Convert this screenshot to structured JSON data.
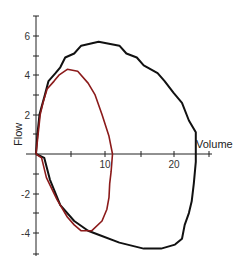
{
  "chart_data": {
    "type": "line",
    "title": "",
    "xlabel": "Volume",
    "ylabel": "Flow",
    "xlim": [
      0,
      25
    ],
    "ylim": [
      -5,
      7
    ],
    "grid": false,
    "legend": null,
    "x_ticks": [
      0,
      5,
      10,
      15,
      20,
      25
    ],
    "x_tick_labels": [
      "",
      "",
      "10",
      "",
      "20",
      ""
    ],
    "y_ticks": [
      -5,
      -4,
      -3,
      -2,
      -1,
      0,
      1,
      2,
      3,
      4,
      5,
      6,
      7
    ],
    "y_tick_labels": {
      "6": "6",
      "4": "4",
      "2": "2",
      "-2": "-2",
      "-4": "-4"
    },
    "series": [
      {
        "name": "large loop",
        "color": "#111111",
        "points": [
          [
            0,
            0
          ],
          [
            0.2,
            1
          ],
          [
            0.5,
            2
          ],
          [
            0.8,
            2.4
          ],
          [
            1.2,
            2.9
          ],
          [
            1.8,
            3.7
          ],
          [
            2.8,
            4.1
          ],
          [
            3.5,
            4.4
          ],
          [
            4.2,
            4.9
          ],
          [
            5.5,
            5.1
          ],
          [
            6.5,
            5.5
          ],
          [
            9,
            5.7
          ],
          [
            12,
            5.5
          ],
          [
            13,
            5.1
          ],
          [
            14.5,
            4.9
          ],
          [
            15.5,
            4.5
          ],
          [
            17.5,
            4.1
          ],
          [
            18.5,
            3.7
          ],
          [
            19.8,
            3.1
          ],
          [
            21,
            2.6
          ],
          [
            22,
            1.7
          ],
          [
            23,
            1.1
          ],
          [
            23,
            -0.4
          ],
          [
            22.7,
            -1.5
          ],
          [
            22.4,
            -2.4
          ],
          [
            22,
            -3
          ],
          [
            21.4,
            -3.6
          ],
          [
            21,
            -4.3
          ],
          [
            20,
            -4.6
          ],
          [
            18,
            -4.8
          ],
          [
            15.5,
            -4.8
          ],
          [
            12,
            -4.5
          ],
          [
            9,
            -4.1
          ],
          [
            7.5,
            -3.9
          ],
          [
            5.5,
            -3.4
          ],
          [
            3.5,
            -2.6
          ],
          [
            2,
            -1.3
          ],
          [
            1.2,
            -0.2
          ],
          [
            0,
            0
          ]
        ]
      },
      {
        "name": "small loop",
        "color": "#8b1a1a",
        "points": [
          [
            0,
            0
          ],
          [
            0.3,
            1
          ],
          [
            0.6,
            2
          ],
          [
            1,
            2.6
          ],
          [
            1.6,
            3.3
          ],
          [
            2.6,
            3.7
          ],
          [
            3.3,
            4.0
          ],
          [
            4.5,
            4.3
          ],
          [
            6,
            4.2
          ],
          [
            7.5,
            3.6
          ],
          [
            8.5,
            3.0
          ],
          [
            9.5,
            2.0
          ],
          [
            10.5,
            0.9
          ],
          [
            11,
            0
          ],
          [
            10.8,
            -0.9
          ],
          [
            10.6,
            -1.5
          ],
          [
            10.5,
            -2.2
          ],
          [
            10.2,
            -2.8
          ],
          [
            9.5,
            -3.4
          ],
          [
            8,
            -3.9
          ],
          [
            6.5,
            -3.9
          ],
          [
            5.5,
            -3.6
          ],
          [
            4.5,
            -3.2
          ],
          [
            3,
            -2.3
          ],
          [
            1.5,
            -1.2
          ],
          [
            0.8,
            -0.2
          ],
          [
            0,
            0
          ]
        ]
      }
    ]
  },
  "axes": {
    "x_label": "Volume",
    "y_label": "Flow",
    "x_tick_10": "10",
    "x_tick_20": "20",
    "y_tick_6": "6",
    "y_tick_4": "4",
    "y_tick_2": "2",
    "y_tick_m2": "-2",
    "y_tick_m4": "-4"
  }
}
